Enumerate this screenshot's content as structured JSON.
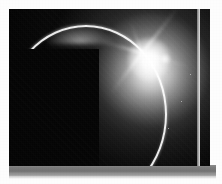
{
  "page": {
    "background_color": "#fdfdfd",
    "width": 222,
    "height": 184
  },
  "photo": {
    "caption": "",
    "alt_description": "Sun flaring from behind the dark limb of a planet, forming a bright crescent arc against a black starfield",
    "frame": {
      "left": 9,
      "top": 9,
      "width": 201,
      "height": 157,
      "background_color": "#050505"
    },
    "shadow_bar": {
      "color": "#7c7c7c",
      "left": 9,
      "top": 165,
      "width": 207,
      "height": 11
    },
    "subject": {
      "scene": "solar-eclipse",
      "sun_center_x": 142,
      "sun_center_y": 52,
      "sun_color": "#ffffff",
      "glow_color": "#e8e8e8",
      "sky_color": "#040404",
      "crescent_color": "#ffffff",
      "flare_spike_count": 6,
      "lens_flare_dot_x": 162,
      "lens_flare_dot_y": 58
    },
    "stars": [
      {
        "x": 28,
        "y": 118
      },
      {
        "x": 47,
        "y": 62
      },
      {
        "x": 63,
        "y": 140
      },
      {
        "x": 86,
        "y": 96
      },
      {
        "x": 104,
        "y": 131
      },
      {
        "x": 33,
        "y": 86
      },
      {
        "x": 118,
        "y": 150
      },
      {
        "x": 74,
        "y": 112
      },
      {
        "x": 168,
        "y": 128
      },
      {
        "x": 181,
        "y": 101
      },
      {
        "x": 155,
        "y": 146
      },
      {
        "x": 190,
        "y": 74
      }
    ]
  }
}
